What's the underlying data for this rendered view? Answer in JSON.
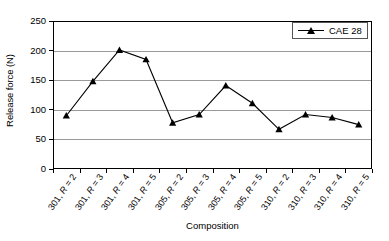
{
  "chart_data": {
    "type": "line",
    "title": "",
    "xlabel": "Composition",
    "ylabel": "Release force (N)",
    "ylim": [
      0,
      250
    ],
    "ytick_values": [
      0,
      50,
      100,
      150,
      200,
      250
    ],
    "ytick_labels": [
      "0",
      "50",
      "100",
      "150",
      "200",
      "250"
    ],
    "grid": true,
    "legend_position": "top-right",
    "categories": [
      "301, R = 2",
      "301, R = 3",
      "301, R = 4",
      "301, R = 5",
      "305, R = 2",
      "305, R = 3",
      "305, R = 4",
      "305, R = 5",
      "310, R = 2",
      "310, R = 3",
      "310, R = 4",
      "310, R = 5"
    ],
    "category_parts": [
      {
        "prefix": "301, ",
        "italic": "R",
        "suffix": " = 2"
      },
      {
        "prefix": "301, ",
        "italic": "R",
        "suffix": " = 3"
      },
      {
        "prefix": "301, ",
        "italic": "R",
        "suffix": " = 4"
      },
      {
        "prefix": "301, ",
        "italic": "R",
        "suffix": " = 5"
      },
      {
        "prefix": "305, ",
        "italic": "R",
        "suffix": " = 2"
      },
      {
        "prefix": "305, ",
        "italic": "R",
        "suffix": " = 3"
      },
      {
        "prefix": "305, ",
        "italic": "R",
        "suffix": " = 4"
      },
      {
        "prefix": "305, ",
        "italic": "R",
        "suffix": " = 5"
      },
      {
        "prefix": "310, ",
        "italic": "R",
        "suffix": " = 2"
      },
      {
        "prefix": "310, ",
        "italic": "R",
        "suffix": " = 3"
      },
      {
        "prefix": "310, ",
        "italic": "R",
        "suffix": " = 4"
      },
      {
        "prefix": "310, ",
        "italic": "R",
        "suffix": " = 5"
      }
    ],
    "series": [
      {
        "name": "CAE 28",
        "marker": "triangle",
        "color": "#000000",
        "values": [
          90,
          148,
          201,
          185,
          78,
          92,
          141,
          111,
          67,
          92,
          87,
          75
        ]
      }
    ]
  },
  "legend": {
    "entries": [
      {
        "label": "CAE 28"
      }
    ]
  },
  "colors": {
    "line": "#000000",
    "marker": "#000000",
    "gridline": "#9a9a9a",
    "axis": "#000000",
    "background": "#ffffff"
  }
}
